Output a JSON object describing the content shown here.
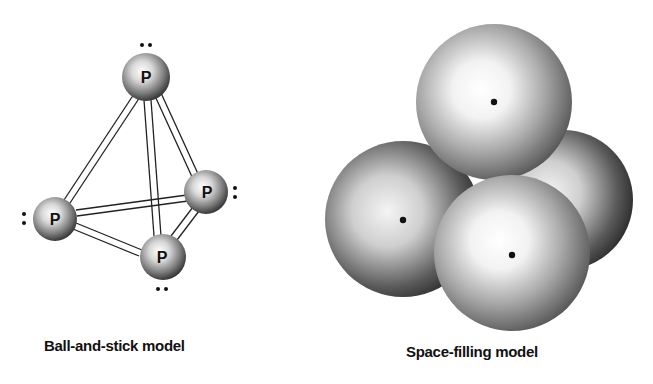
{
  "diagram": {
    "molecule": "P4",
    "ball_and_stick": {
      "caption": "Ball-and-stick model",
      "atoms": [
        {
          "id": "top",
          "symbol": "P",
          "x": 146,
          "y": 77,
          "r": 24,
          "lone_pair": "above"
        },
        {
          "id": "right",
          "symbol": "P",
          "x": 206,
          "y": 192,
          "r": 22,
          "lone_pair": "right"
        },
        {
          "id": "left",
          "symbol": "P",
          "x": 55,
          "y": 219,
          "r": 22,
          "lone_pair": "left"
        },
        {
          "id": "bottom",
          "symbol": "P",
          "x": 163,
          "y": 257,
          "r": 23,
          "lone_pair": "below"
        }
      ],
      "bonds": [
        [
          "top",
          "left"
        ],
        [
          "top",
          "right"
        ],
        [
          "top",
          "bottom"
        ],
        [
          "left",
          "right"
        ],
        [
          "left",
          "bottom"
        ],
        [
          "right",
          "bottom"
        ]
      ]
    },
    "space_filling": {
      "caption": "Space-filling model",
      "spheres": [
        {
          "id": "right",
          "x": 563,
          "y": 200,
          "r": 70
        },
        {
          "id": "left",
          "x": 403,
          "y": 219,
          "r": 78
        },
        {
          "id": "top",
          "x": 494,
          "y": 102,
          "r": 78
        },
        {
          "id": "bottom",
          "x": 512,
          "y": 253,
          "r": 78
        }
      ]
    }
  }
}
